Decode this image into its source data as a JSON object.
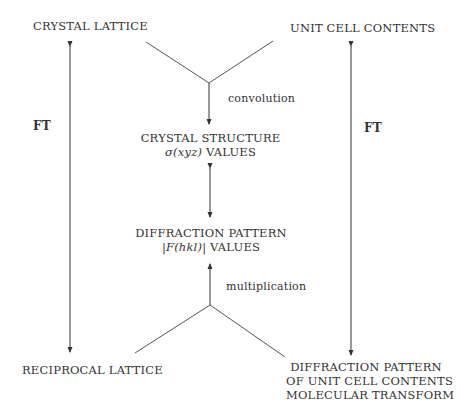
{
  "diagram": {
    "nodes": {
      "crystal_lattice": "CRYSTAL LATTICE",
      "unit_cell_contents": "UNIT CELL CONTENTS",
      "crystal_structure": {
        "line1": "CRYSTAL STRUCTURE",
        "line2_math": "σ(xyz)",
        "line2_text": " VALUES"
      },
      "diffraction_pattern": {
        "line1": "DIFFRACTION PATTERN",
        "line2_math": "|F(hkl)|",
        "line2_text": " VALUES"
      },
      "reciprocal_lattice": "RECIPROCAL LATTICE",
      "diffraction_unit_cell": {
        "line1": "DIFFRACTION PATTERN",
        "line2": "OF UNIT CELL CONTENTS",
        "line3": "MOLECULAR TRANSFORM"
      }
    },
    "edge_labels": {
      "convolution": "convolution",
      "multiplication": "multiplication",
      "ft_left": "FT",
      "ft_right": "FT"
    }
  }
}
